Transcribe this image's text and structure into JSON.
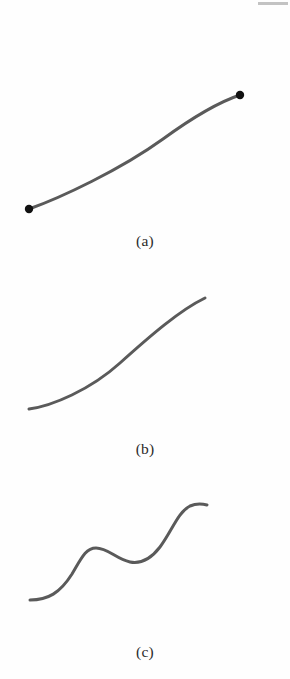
{
  "figure": {
    "background_color": "#fefefe",
    "stroke_color": "#5a5a5a",
    "endpoint_color": "#111111",
    "stroke_width": 3,
    "endpoint_radius": 4.2,
    "scan_artifact": {
      "name": "top-right-gray-rule",
      "color": "#b9b9b9"
    }
  },
  "panels": [
    {
      "id": "a",
      "caption": "(a)",
      "description": "concave-down arc rising left to right",
      "path": "M 29 209 C 60 198, 120 170, 163 139 C 196 115, 222 101, 240 95",
      "endpoints": [
        {
          "name": "start-point",
          "x": 29,
          "y": 209
        },
        {
          "name": "end-point",
          "x": 240,
          "y": 95
        }
      ]
    },
    {
      "id": "b",
      "caption": "(b)",
      "description": "concave-up arc rising left to right",
      "path": "M 29 147 C 52 144, 90 128, 120 101, C 150 74, 180 48, 205 36",
      "endpoints": [
        {
          "name": "start-point",
          "x": 29,
          "y": 147
        },
        {
          "name": "end-point",
          "x": 205,
          "y": 36
        }
      ]
    },
    {
      "id": "c",
      "caption": "(c)",
      "description": "wavy sinusoidal curve rising left to right",
      "path": "M 30 125 C 48 125, 60 118, 72 99 C 82 82, 86 73, 96 73 C 108 73, 116 84, 130 87 C 140 89, 150 85, 160 72 C 172 56, 178 37, 190 31 C 197 28, 203 29, 207 30",
      "endpoints": [
        {
          "name": "start-point",
          "x": 30,
          "y": 125
        },
        {
          "name": "end-point",
          "x": 207,
          "y": 30
        }
      ]
    }
  ],
  "chart_data": {
    "type": "line",
    "title": "",
    "xlabel": "",
    "ylabel": "",
    "grid": false,
    "legend": "none",
    "note": "Three schematic curve sketches labeled (a), (b), (c); no numeric axes are shown.",
    "series": [
      {
        "name": "(a)",
        "shape": "concave-down increasing arc",
        "x": [
          29,
          50,
          75,
          100,
          125,
          150,
          175,
          200,
          225,
          240
        ],
        "y": [
          209,
          200,
          188,
          175,
          160,
          144,
          128,
          113,
          101,
          95
        ]
      },
      {
        "name": "(b)",
        "shape": "concave-up increasing arc",
        "x": [
          29,
          50,
          70,
          90,
          110,
          130,
          150,
          170,
          190,
          205
        ],
        "y": [
          409,
          404,
          396,
          385,
          371,
          355,
          338,
          320,
          306,
          298
        ]
      },
      {
        "name": "(c)",
        "shape": "wavy increasing curve with one crest and one trough",
        "x": [
          30,
          45,
          60,
          75,
          92,
          110,
          128,
          142,
          158,
          175,
          192,
          207
        ],
        "y": [
          600,
          598,
          590,
          572,
          548,
          548,
          557,
          562,
          558,
          536,
          509,
          505
        ]
      }
    ]
  }
}
